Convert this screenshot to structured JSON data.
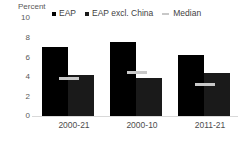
{
  "chart_data": {
    "type": "bar",
    "title": "",
    "xlabel": "",
    "ylabel": "Percent",
    "ylim": [
      0,
      10
    ],
    "yticks": [
      10,
      8,
      6,
      4,
      2,
      0
    ],
    "grid": false,
    "legend_position": "top",
    "categories": [
      "2000-21",
      "2000-10",
      "2011-21"
    ],
    "series": [
      {
        "name": "EAP",
        "type": "bar",
        "color": "#000000",
        "values": [
          7.0,
          7.6,
          6.2
        ]
      },
      {
        "name": "EAP excl. China",
        "type": "bar",
        "color": "#1a1a1a",
        "values": [
          4.2,
          3.9,
          4.4
        ]
      },
      {
        "name": "Median",
        "type": "marker",
        "color": "#c8c8c8",
        "values": [
          3.8,
          4.4,
          3.2
        ]
      }
    ]
  },
  "legend": {
    "items": [
      {
        "label": "EAP",
        "marker": "square",
        "color": "#000000"
      },
      {
        "label": "EAP excl. China",
        "marker": "square",
        "color": "#1a1a1a"
      },
      {
        "label": "Median",
        "marker": "dash",
        "color": "#c8c8c8"
      }
    ]
  },
  "axis": {
    "y_title": "Percent",
    "y_tick_labels": [
      "10",
      "8",
      "6",
      "4",
      "2",
      "0"
    ],
    "x_tick_labels": [
      "2000-21",
      "2000-10",
      "2011-21"
    ]
  }
}
